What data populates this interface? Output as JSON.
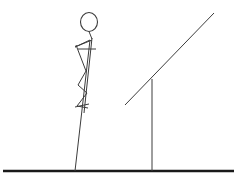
{
  "scene": {
    "title": "Stick figure balancing on a pole beside an inclined ramp",
    "background_color": "#ffffff",
    "stroke_color": "#3c3c3c",
    "ground_color": "#1a1a1a",
    "width": 240,
    "height": 181
  },
  "ground": {
    "label": "ground",
    "x1": 3,
    "y1": 171,
    "x2": 234,
    "y2": 171
  },
  "figure": {
    "label": "stick-figure",
    "head": {
      "cx": 89,
      "cy": 22,
      "rx": 8.5,
      "ry": 9.5
    },
    "neck": {
      "x1": 89,
      "y1": 31.5,
      "x2": 92,
      "y2": 39
    },
    "torso": {
      "x1": 92,
      "y1": 38,
      "x2": 84,
      "y2": 113
    },
    "arm_upper": {
      "x1": 90,
      "y1": 40,
      "x2": 75,
      "y2": 47
    },
    "arm_fore": {
      "x1": 75,
      "y1": 47,
      "x2": 92,
      "y2": 40
    },
    "arm_cross": {
      "x1": 78,
      "y1": 49,
      "x2": 96,
      "y2": 49
    },
    "arm_down": {
      "x1": 76,
      "y1": 45,
      "x2": 86,
      "y2": 71
    },
    "thigh": {
      "x1": 86,
      "y1": 71,
      "x2": 78,
      "y2": 85
    },
    "shin": {
      "x1": 78,
      "y1": 85,
      "x2": 87,
      "y2": 93
    },
    "thigh2": {
      "x1": 87,
      "y1": 93,
      "x2": 77,
      "y2": 106
    },
    "shin2": {
      "x1": 77,
      "y1": 106,
      "x2": 88,
      "y2": 108
    },
    "foot_line": {
      "x1": 75,
      "y1": 107,
      "x2": 89,
      "y2": 104
    },
    "pole_leg": {
      "x1": 90,
      "y1": 40,
      "x2": 75,
      "y2": 171
    }
  },
  "ramp": {
    "label": "inclined-ramp",
    "beam": {
      "x1": 125,
      "y1": 105,
      "x2": 214,
      "y2": 13
    },
    "post": {
      "x1": 152,
      "y1": 79,
      "x2": 152,
      "y2": 171
    }
  }
}
